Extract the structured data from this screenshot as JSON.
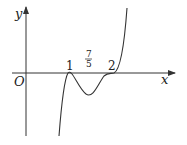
{
  "diagram": {
    "type": "function-graph",
    "axes": {
      "x_label": "x",
      "y_label": "y",
      "origin_label": "O"
    },
    "tick_labels": [
      {
        "name": "root-1",
        "text": "1"
      },
      {
        "name": "fraction",
        "numerator": "7",
        "denominator": "5"
      },
      {
        "name": "root-2",
        "text": "2"
      }
    ],
    "colors": {
      "axis": "#333333",
      "curve": "#333333",
      "text": "#222222"
    }
  }
}
